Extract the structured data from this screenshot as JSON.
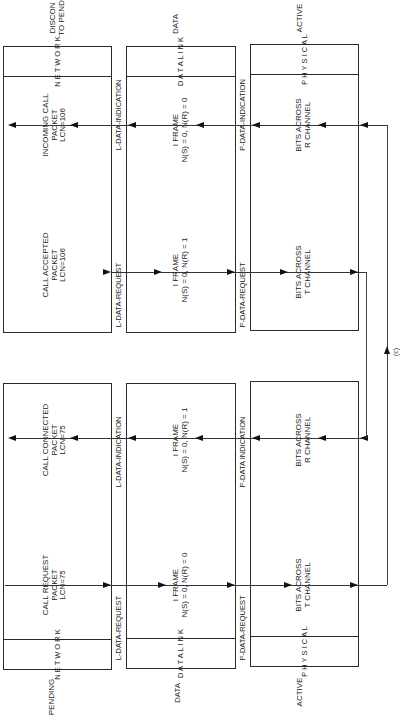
{
  "diagram": {
    "orientation": "rotated 90 degrees counter-clockwise",
    "top_half": {
      "state_labels": {
        "network": "DISCON\nTO PEND",
        "data_link": "DATA",
        "physical": "ACTIVE"
      },
      "layers": {
        "network": {
          "header": "N E T W O R K",
          "messages": [
            {
              "text": "CALL ACCEPTED\nPACKET\nLCN=106",
              "direction": "down"
            },
            {
              "text": "INCOMING CALL\nPACKET\nLCN=106",
              "direction": "up"
            }
          ]
        },
        "between_network_datalink": {
          "left_label": "L-DATA-REQUEST",
          "right_label": "L-DATA-INDICATION"
        },
        "data_link": {
          "header": "D A T A   L I N K",
          "messages": [
            {
              "text": "I FRAME\nN(S) = 0, N(R) = 1",
              "direction": "down"
            },
            {
              "text": "I FRAME\nN(S) = 0, N(R) = 0",
              "direction": "up"
            }
          ]
        },
        "between_datalink_physical": {
          "left_label": "P-DATA-REQUEST",
          "right_label": "P-DATA-INDICATION"
        },
        "physical": {
          "header": "P H Y S I C A L",
          "messages": [
            {
              "text": "BITS ACROSS\nT CHANNEL",
              "direction": "down"
            },
            {
              "text": "BITS ACROSS\nR CHANNEL",
              "direction": "up"
            }
          ]
        }
      }
    },
    "bottom_half": {
      "state_labels": {
        "network": "PENDING",
        "data_link": "DATA",
        "physical": "ACTIVE"
      },
      "layers": {
        "network": {
          "header": "N E T W O R K",
          "messages": [
            {
              "text": "CALL REQUEST\nPACKET\nLCN=75",
              "direction": "down"
            },
            {
              "text": "CALL CONNECTED\nPACKET\nLCN=75",
              "direction": "up"
            }
          ]
        },
        "between_network_datalink": {
          "left_label": "L-DATA-REQUEST",
          "right_label": "L-DATA-INDICATION"
        },
        "data_link": {
          "header": "D A T A   L I N K",
          "messages": [
            {
              "text": "I FRAME\nN(S) = 0, N(R) = 0",
              "direction": "down"
            },
            {
              "text": "I FRAME\nN(S) = 0, N(R) = 1",
              "direction": "up"
            }
          ]
        },
        "between_datalink_physical": {
          "left_label": "P-DATA-REQUEST",
          "right_label": "P-DATA INDICATION"
        },
        "physical": {
          "header": "P H Y S I C A L",
          "messages": [
            {
              "text": "BITS ACROSS\nT CHANNEL",
              "direction": "down"
            },
            {
              "text": "BITS ACROSS\nR CHANNEL",
              "direction": "up"
            }
          ]
        }
      }
    },
    "connector_label": "(c)"
  }
}
